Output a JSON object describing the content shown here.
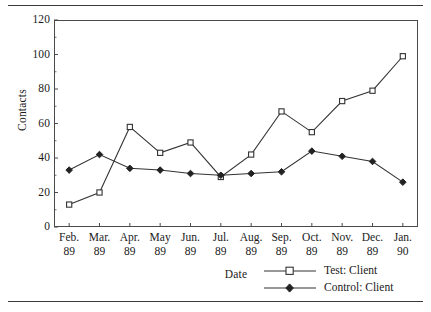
{
  "chart_data": {
    "type": "line",
    "title": "",
    "xlabel": "Date",
    "ylabel": "Contacts",
    "ylim": [
      0,
      120
    ],
    "yticks": [
      0,
      20,
      40,
      60,
      80,
      100,
      120
    ],
    "grid": false,
    "legend_position": "bottom-right",
    "categories": [
      "Feb. 89",
      "Mar. 89",
      "Apr. 89",
      "May 89",
      "Jun. 89",
      "Jul. 89",
      "Aug. 89",
      "Sep. 89",
      "Oct. 89",
      "Nov. 89",
      "Dec. 89",
      "Jan. 90"
    ],
    "category_lines": [
      [
        "Feb.",
        "89"
      ],
      [
        "Mar.",
        "89"
      ],
      [
        "Apr.",
        "89"
      ],
      [
        "May",
        "89"
      ],
      [
        "Jun.",
        "89"
      ],
      [
        "Jul.",
        "89"
      ],
      [
        "Aug.",
        "89"
      ],
      [
        "Sep.",
        "89"
      ],
      [
        "Oct.",
        "89"
      ],
      [
        "Nov.",
        "89"
      ],
      [
        "Dec.",
        "89"
      ],
      [
        "Jan.",
        "90"
      ]
    ],
    "series": [
      {
        "name": "Test: Client",
        "marker": "open-square",
        "values": [
          13,
          20,
          58,
          43,
          49,
          29,
          42,
          67,
          55,
          73,
          79,
          99
        ]
      },
      {
        "name": "Control: Client",
        "marker": "filled-diamond",
        "values": [
          33,
          42,
          34,
          33,
          31,
          30,
          31,
          32,
          44,
          41,
          38,
          26
        ]
      }
    ]
  },
  "axes": {
    "y_title": "Contacts",
    "x_title": "Date",
    "y_tick_labels": [
      "0",
      "20",
      "40",
      "60",
      "80",
      "100",
      "120"
    ]
  },
  "legend": {
    "items": [
      {
        "label": "Test: Client",
        "marker": "open-square"
      },
      {
        "label": "Control: Client",
        "marker": "filled-diamond"
      }
    ]
  },
  "colors": {
    "line": "#333333",
    "frame": "#4a4a4a",
    "rule": "#3a3a3a",
    "text": "#1a1a1a",
    "marker_fill": "#ffffff"
  }
}
